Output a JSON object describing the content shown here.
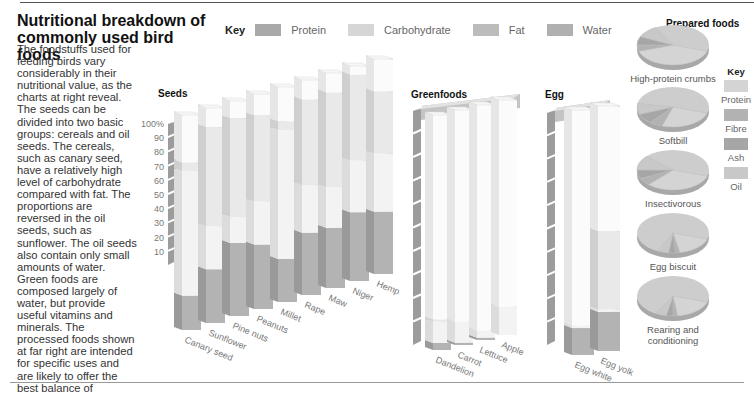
{
  "title": "Nutritional breakdown of commonly used bird foods",
  "intro": "The foodstuffs used for feeding birds vary considerably in their nutritional value, as the charts at right reveal. The seeds can be divided into two basic groups: cereals and oil seeds. The cereals, such as canary seed, have a relatively high level of carbohydrate compared with fat. The proportions are reversed in the oil seeds, such as sunflower. The oil seeds also contain only small amounts of water. Green foods are composed largely of water, but provide useful vitamins and minerals. The processed foods shown at far right are intended for specific uses and are likely to offer the best balance of vitamins and minerals.",
  "key": {
    "label": "Key",
    "items": [
      {
        "name": "Protein",
        "color": "#a9a9a9"
      },
      {
        "name": "Carbohydrate",
        "color": "#d6d6d6"
      },
      {
        "name": "Fat",
        "color": "#b8b8b8"
      },
      {
        "name": "Water",
        "color": "#b0b0b0"
      }
    ]
  },
  "prepared_key": {
    "label": "Key",
    "items": [
      {
        "name": "Protein",
        "color": "#d4d4d4"
      },
      {
        "name": "Fibre",
        "color": "#b2b2b2"
      },
      {
        "name": "Ash",
        "color": "#a6a6a6"
      },
      {
        "name": "Oil",
        "color": "#c8c8c8"
      }
    ]
  },
  "sections": {
    "seeds": "Seeds",
    "greenfoods": "Greenfoods",
    "egg": "Egg",
    "prepared": "Prepared foods"
  },
  "chart_data": [
    {
      "type": "bar",
      "title": "Seeds",
      "stacked": true,
      "ylabel": "%",
      "ylim": [
        0,
        100
      ],
      "yticks": [
        "10",
        "20",
        "30",
        "40",
        "50",
        "60",
        "70",
        "80",
        "90",
        "100%"
      ],
      "categories": [
        "Canary seed",
        "Sunflower",
        "Pine nuts",
        "Peanuts",
        "Millet",
        "Rape",
        "Maw",
        "Niger",
        "Hemp"
      ],
      "series": [
        {
          "name": "Protein",
          "values": [
            16,
            25,
            34,
            30,
            20,
            29,
            28,
            32,
            29
          ]
        },
        {
          "name": "Carbohydrate",
          "values": [
            58,
            20,
            12,
            20,
            60,
            22,
            19,
            24,
            27
          ]
        },
        {
          "name": "Fat",
          "values": [
            4,
            46,
            46,
            40,
            4,
            40,
            44,
            40,
            29
          ]
        },
        {
          "name": "Water",
          "values": [
            22,
            9,
            8,
            10,
            16,
            9,
            9,
            4,
            15
          ]
        }
      ]
    },
    {
      "type": "bar",
      "title": "Greenfoods",
      "stacked": true,
      "ylim": [
        0,
        100
      ],
      "categories": [
        "Dandelion",
        "Carrot",
        "Lettuce",
        "Apple"
      ],
      "series": [
        {
          "name": "Protein",
          "values": [
            3,
            1,
            1,
            0
          ]
        },
        {
          "name": "Carbohydrate",
          "values": [
            9,
            9,
            3,
            12
          ]
        },
        {
          "name": "Fat",
          "values": [
            1,
            0,
            0,
            0
          ]
        },
        {
          "name": "Water",
          "values": [
            87,
            90,
            96,
            88
          ]
        }
      ]
    },
    {
      "type": "bar",
      "title": "Egg",
      "stacked": true,
      "ylim": [
        0,
        100
      ],
      "categories": [
        "Egg white",
        "Egg yolk"
      ],
      "series": [
        {
          "name": "Protein",
          "values": [
            11,
            16
          ]
        },
        {
          "name": "Carbohydrate",
          "values": [
            1,
            1
          ]
        },
        {
          "name": "Fat",
          "values": [
            0,
            32
          ]
        },
        {
          "name": "Water",
          "values": [
            88,
            51
          ]
        }
      ]
    },
    {
      "type": "pie",
      "title": "Prepared foods",
      "legend": [
        "Protein",
        "Fibre",
        "Ash",
        "Oil"
      ],
      "pies": [
        {
          "name": "High-protein crumbs",
          "values": {
            "Protein": 40,
            "Fibre": 5,
            "Ash": 7,
            "Oil": 10,
            "Other": 38
          }
        },
        {
          "name": "Softbill",
          "values": {
            "Protein": 25,
            "Fibre": 6,
            "Ash": 8,
            "Oil": 9,
            "Other": 52
          }
        },
        {
          "name": "Insectivorous",
          "values": {
            "Protein": 32,
            "Fibre": 6,
            "Ash": 7,
            "Oil": 12,
            "Other": 43
          }
        },
        {
          "name": "Egg biscuit",
          "values": {
            "Protein": 17,
            "Fibre": 2,
            "Ash": 3,
            "Oil": 5,
            "Other": 73
          }
        },
        {
          "name": "Rearing and conditioning",
          "values": {
            "Protein": 18,
            "Fibre": 2,
            "Ash": 3,
            "Oil": 5,
            "Other": 72
          }
        }
      ]
    }
  ]
}
